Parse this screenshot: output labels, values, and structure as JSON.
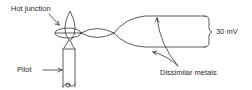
{
  "diagram": {
    "labels": {
      "hot_junction": "Hot junction",
      "pilot": "Pilot",
      "voltage": "30 mV",
      "dissimilar_metals": "Dissimilar metals"
    },
    "colors": {
      "line": "#333333",
      "text": "#2a2a2a",
      "background": "#ffffff"
    }
  }
}
